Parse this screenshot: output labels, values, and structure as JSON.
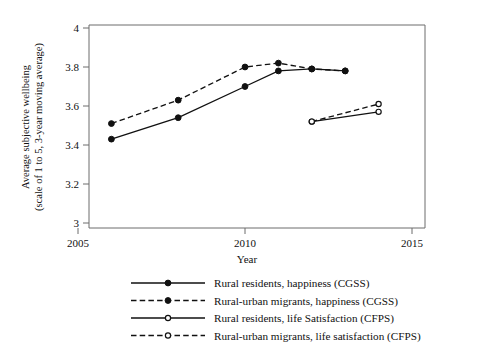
{
  "chart_data": {
    "type": "line",
    "title": "",
    "xlabel": "Year",
    "ylabel": "Average subjective wellbeing",
    "ylabel_line2": "(scale of 1 to 5, 3-year moving average)",
    "xlim": [
      2005,
      2015.4
    ],
    "ylim": [
      3,
      4
    ],
    "xticks": [
      2005,
      2010,
      2015
    ],
    "xtick_labels": [
      "2005",
      "2010",
      "2015"
    ],
    "yticks": [
      3,
      3.2,
      3.4,
      3.6,
      3.8,
      4
    ],
    "ytick_labels": [
      "3",
      "3.2",
      "3.4",
      "3.6",
      "3.8",
      "4"
    ],
    "grid": false,
    "legend_position": "below",
    "series": [
      {
        "name": "Rural residents, happiness (CGSS)",
        "style": "solid",
        "marker": "filled-circle",
        "x": [
          2006,
          2008,
          2010,
          2011,
          2012,
          2013
        ],
        "values": [
          3.43,
          3.54,
          3.7,
          3.78,
          3.79,
          3.78
        ]
      },
      {
        "name": "Rural-urban migrants, happiness (CGSS)",
        "style": "dashed",
        "marker": "filled-circle",
        "x": [
          2006,
          2008,
          2010,
          2011,
          2012,
          2013
        ],
        "values": [
          3.51,
          3.63,
          3.8,
          3.82,
          3.79,
          3.78
        ]
      },
      {
        "name": "Rural residents, life Satisfaction (CFPS)",
        "style": "solid",
        "marker": "open-circle",
        "x": [
          2012,
          2014
        ],
        "values": [
          3.52,
          3.57
        ]
      },
      {
        "name": "Rural-urban migrants, life satisfaction (CFPS)",
        "style": "dashed",
        "marker": "open-circle",
        "x": [
          2012,
          2014
        ],
        "values": [
          3.52,
          3.61
        ]
      }
    ]
  },
  "legend": {
    "items": [
      {
        "label": "Rural residents, happiness (CGSS)",
        "style": "solid",
        "marker": "filled-circle"
      },
      {
        "label": "Rural-urban migrants, happiness (CGSS)",
        "style": "dashed",
        "marker": "filled-circle"
      },
      {
        "label": "Rural residents, life Satisfaction (CFPS)",
        "style": "solid",
        "marker": "open-circle"
      },
      {
        "label": "Rural-urban migrants, life satisfaction (CFPS)",
        "style": "dashed",
        "marker": "open-circle"
      }
    ]
  },
  "colors": {
    "ink": "#111111",
    "axis": "#6d6d6d",
    "background": "#ffffff"
  }
}
